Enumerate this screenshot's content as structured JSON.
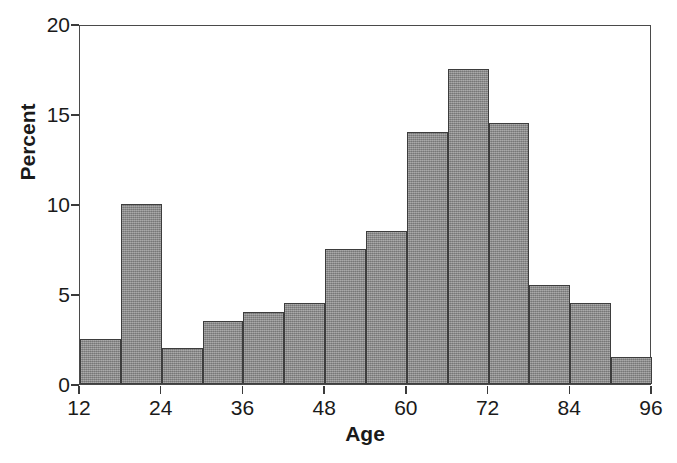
{
  "chart_data": {
    "type": "bar",
    "title": "",
    "xlabel": "Age",
    "ylabel": "Percent",
    "xlim": [
      12,
      96
    ],
    "ylim": [
      0,
      20
    ],
    "grid": false,
    "legend": null,
    "bin_width": 6,
    "bin_edges": [
      12,
      18,
      24,
      30,
      36,
      42,
      48,
      54,
      60,
      66,
      72,
      78,
      84,
      90,
      96
    ],
    "categories": [
      "12-18",
      "18-24",
      "24-30",
      "30-36",
      "36-42",
      "42-48",
      "48-54",
      "54-60",
      "60-66",
      "66-72",
      "72-78",
      "78-84",
      "84-90",
      "90-96"
    ],
    "values": [
      2.5,
      10.0,
      2.0,
      3.5,
      4.0,
      4.5,
      7.5,
      8.5,
      14.0,
      17.5,
      14.5,
      5.5,
      4.5,
      1.5
    ],
    "xticks": [
      12,
      24,
      36,
      48,
      60,
      72,
      84,
      96
    ],
    "xtick_labels": [
      "12",
      "24",
      "36",
      "48",
      "60",
      "72",
      "84",
      "96"
    ],
    "yticks": [
      0,
      5,
      10,
      15,
      20
    ],
    "ytick_labels": [
      "0",
      "5",
      "10",
      "15",
      "20"
    ],
    "bar_fill_color": "#8e8e8e",
    "bar_edge_color": "#3d3d3d",
    "axis_color": "#4a4a4a",
    "background_color": "#ffffff"
  },
  "caption": {
    "text": ""
  }
}
